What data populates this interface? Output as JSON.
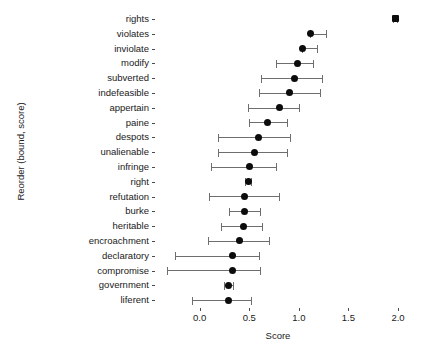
{
  "chart_data": {
    "type": "scatter",
    "title": "",
    "xlabel": "Score",
    "ylabel": "Reorder (bound, score)",
    "xlim": [
      -0.42,
      2.0
    ],
    "xticks": [
      0.0,
      0.5,
      1.0,
      1.5,
      2.0
    ],
    "xticklabels": [
      "0.0",
      "0.5",
      "1.0",
      "1.5",
      "2.0"
    ],
    "grid": false,
    "legend": null,
    "marker_color": "#0c0c0c",
    "errorbar_color": "#6e6e6e",
    "orientation": "horizontal",
    "categories": [
      "rights",
      "violates",
      "inviolate",
      "modify",
      "subverted",
      "indefeasible",
      "appertain",
      "paine",
      "despots",
      "unalienable",
      "infringe",
      "right",
      "refutation",
      "burke",
      "heritable",
      "encroachment",
      "declaratory",
      "compromise",
      "government",
      "liferent"
    ],
    "points": [
      {
        "label": "rights",
        "score": 1.97,
        "low": 1.95,
        "high": 1.99
      },
      {
        "label": "violates",
        "score": 1.12,
        "low": 1.11,
        "high": 1.27
      },
      {
        "label": "inviolate",
        "score": 1.04,
        "low": 1.03,
        "high": 1.18
      },
      {
        "label": "modify",
        "score": 0.99,
        "low": 0.77,
        "high": 1.14
      },
      {
        "label": "subverted",
        "score": 0.96,
        "low": 0.62,
        "high": 1.23
      },
      {
        "label": "indefeasible",
        "score": 0.91,
        "low": 0.6,
        "high": 1.21
      },
      {
        "label": "appertain",
        "score": 0.81,
        "low": 0.49,
        "high": 1.0
      },
      {
        "label": "paine",
        "score": 0.68,
        "low": 0.5,
        "high": 0.88
      },
      {
        "label": "despots",
        "score": 0.59,
        "low": 0.18,
        "high": 0.91
      },
      {
        "label": "unalienable",
        "score": 0.55,
        "low": 0.19,
        "high": 0.88
      },
      {
        "label": "infringe",
        "score": 0.5,
        "low": 0.11,
        "high": 0.77
      },
      {
        "label": "right",
        "score": 0.49,
        "low": 0.46,
        "high": 0.52
      },
      {
        "label": "refutation",
        "score": 0.45,
        "low": 0.09,
        "high": 0.8
      },
      {
        "label": "burke",
        "score": 0.45,
        "low": 0.3,
        "high": 0.61
      },
      {
        "label": "heritable",
        "score": 0.44,
        "low": 0.22,
        "high": 0.63
      },
      {
        "label": "encroachment",
        "score": 0.4,
        "low": 0.08,
        "high": 0.7
      },
      {
        "label": "declaratory",
        "score": 0.33,
        "low": -0.25,
        "high": 0.6
      },
      {
        "label": "compromise",
        "score": 0.33,
        "low": -0.33,
        "high": 0.61
      },
      {
        "label": "government",
        "score": 0.29,
        "low": 0.25,
        "high": 0.34
      },
      {
        "label": "liferent",
        "score": 0.29,
        "low": -0.08,
        "high": 0.52
      }
    ]
  }
}
